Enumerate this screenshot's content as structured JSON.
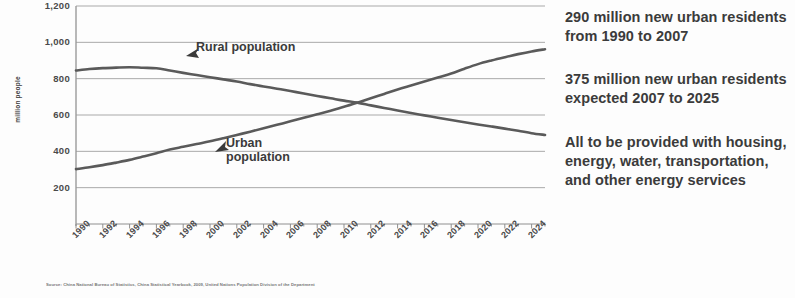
{
  "chart_data": {
    "type": "line",
    "title": "",
    "xlabel": "",
    "ylabel": "million people",
    "ylim": [
      0,
      1200
    ],
    "ytick_values": [
      "1,200",
      "1,000",
      "800",
      "600",
      "400",
      "200"
    ],
    "grid": true,
    "legend_position": "inline-annotation",
    "x": [
      1990,
      1991,
      1992,
      1993,
      1994,
      1995,
      1996,
      1997,
      1998,
      1999,
      2000,
      2001,
      2002,
      2003,
      2004,
      2005,
      2006,
      2007,
      2008,
      2009,
      2010,
      2011,
      2012,
      2013,
      2014,
      2015,
      2016,
      2017,
      2018,
      2019,
      2020,
      2021,
      2022,
      2023,
      2024,
      2025
    ],
    "xtick_labels": [
      "1990",
      "1992",
      "1994",
      "1996",
      "1998",
      "2000",
      "2002",
      "2004",
      "2006",
      "2008",
      "2010",
      "2012",
      "2014",
      "2016",
      "2018",
      "2020",
      "2022",
      "2024"
    ],
    "series": [
      {
        "name": "Rural population",
        "values": [
          845,
          853,
          858,
          861,
          863,
          860,
          857,
          845,
          832,
          820,
          808,
          796,
          784,
          770,
          757,
          745,
          732,
          718,
          705,
          692,
          679,
          668,
          653,
          639,
          625,
          611,
          598,
          585,
          572,
          560,
          548,
          537,
          525,
          513,
          500,
          490
        ]
      },
      {
        "name": "Urban population",
        "values": [
          302,
          312,
          324,
          338,
          353,
          371,
          390,
          410,
          425,
          440,
          455,
          472,
          490,
          508,
          527,
          546,
          565,
          585,
          604,
          624,
          645,
          668,
          692,
          716,
          740,
          762,
          784,
          806,
          828,
          855,
          880,
          900,
          918,
          935,
          950,
          962
        ]
      }
    ],
    "annotations": [
      {
        "text": "Rural population",
        "arrow": "left"
      },
      {
        "text": "Urban population",
        "arrow": "left"
      }
    ],
    "source": "Source: China National Bureau of Statistics, China Statistical Yearbook, 2009, United Nations Population Division of the Department"
  },
  "text_panel": {
    "bullets": [
      "290 million new urban residents from 1990 to 2007",
      "375 million new urban residents expected 2007 to 2025",
      "All to be provided with housing, energy, water, transportation, and other energy services"
    ]
  }
}
